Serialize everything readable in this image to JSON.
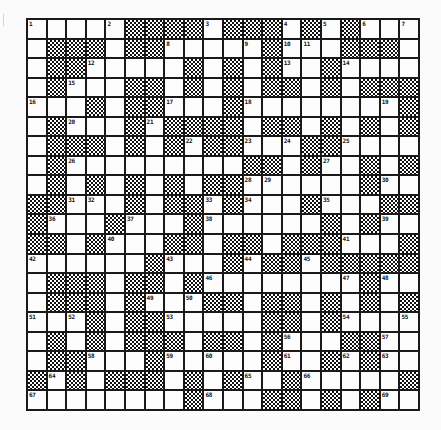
{
  "puzzle": {
    "type": "crossword",
    "rows": 20,
    "cols": 20,
    "colors": {
      "grid_line": "#1a1a1a",
      "white_cell": "#fdfdfd",
      "block_pattern_dark": "#111111",
      "page_background": "#fbfbfb"
    },
    "legend": {
      "W": "white (fillable) cell",
      "B": "black (blocked) cell, drawn with checkerboard dither"
    },
    "layout": [
      "WWWWWBBBBWBBBWBWBWWW",
      "WBBBWBBWWWWWBWWWBBBW",
      "WBBWWWWWBWBWBWWBWWWW",
      "WBWWWBBWBWBWBBWBWBBB",
      "WWWBWBBWWWBWWWWWWWWB",
      "WBWWWBWBBBBWBBWBWBWB",
      "WBBBWBWBWBBWWWBBWWWW",
      "WBWWWWWWWWWBBWBWWBWB",
      "WBWBWBWBWBBWWWWWWBWW",
      "BBWWWBWBBWBWWWBWWWBB",
      "BWWWBWWWBWWWWWWBWBWW",
      "BBWBWWWBBWBBWBBBWWWB",
      "WWWWWWBWWWBWBBWBBBBB",
      "WBBBWBBWBWWWWWWWWBWW",
      "WBBBWBWWWBBWBBWBWBWB",
      "WWWBWBBWWWWWBBWBWWWW",
      "WBWBWBBBWBBWBWWWBBWW",
      "WBBWWWBWWWWWBWWBWBWW",
      "BWBWBBBWBWBWWBWWWWWB",
      "WWWWWWWWBWWWBBWBWBWW"
    ],
    "clue_numbers": [
      {
        "row": 0,
        "col": 0,
        "n": "1"
      },
      {
        "row": 0,
        "col": 4,
        "n": "2"
      },
      {
        "row": 0,
        "col": 9,
        "n": "3"
      },
      {
        "row": 0,
        "col": 13,
        "n": "4"
      },
      {
        "row": 0,
        "col": 15,
        "n": "5"
      },
      {
        "row": 0,
        "col": 17,
        "n": "6"
      },
      {
        "row": 0,
        "col": 19,
        "n": "7"
      },
      {
        "row": 1,
        "col": 7,
        "n": "8"
      },
      {
        "row": 1,
        "col": 11,
        "n": "9"
      },
      {
        "row": 1,
        "col": 13,
        "n": "10"
      },
      {
        "row": 1,
        "col": 14,
        "n": "11"
      },
      {
        "row": 2,
        "col": 3,
        "n": "12"
      },
      {
        "row": 2,
        "col": 13,
        "n": "13"
      },
      {
        "row": 2,
        "col": 16,
        "n": "14"
      },
      {
        "row": 3,
        "col": 2,
        "n": "15"
      },
      {
        "row": 4,
        "col": 0,
        "n": "16"
      },
      {
        "row": 4,
        "col": 7,
        "n": "17"
      },
      {
        "row": 4,
        "col": 11,
        "n": "18"
      },
      {
        "row": 4,
        "col": 18,
        "n": "19"
      },
      {
        "row": 5,
        "col": 2,
        "n": "20"
      },
      {
        "row": 5,
        "col": 6,
        "n": "21"
      },
      {
        "row": 6,
        "col": 8,
        "n": "22"
      },
      {
        "row": 6,
        "col": 11,
        "n": "23"
      },
      {
        "row": 6,
        "col": 13,
        "n": "24"
      },
      {
        "row": 6,
        "col": 16,
        "n": "25"
      },
      {
        "row": 7,
        "col": 2,
        "n": "26"
      },
      {
        "row": 7,
        "col": 15,
        "n": "27"
      },
      {
        "row": 8,
        "col": 11,
        "n": "28"
      },
      {
        "row": 8,
        "col": 12,
        "n": "29"
      },
      {
        "row": 8,
        "col": 18,
        "n": "30"
      },
      {
        "row": 9,
        "col": 2,
        "n": "31"
      },
      {
        "row": 9,
        "col": 3,
        "n": "32"
      },
      {
        "row": 9,
        "col": 9,
        "n": "33"
      },
      {
        "row": 9,
        "col": 11,
        "n": "34"
      },
      {
        "row": 9,
        "col": 15,
        "n": "35"
      },
      {
        "row": 10,
        "col": 1,
        "n": "36"
      },
      {
        "row": 10,
        "col": 5,
        "n": "37"
      },
      {
        "row": 10,
        "col": 9,
        "n": "38"
      },
      {
        "row": 10,
        "col": 18,
        "n": "39"
      },
      {
        "row": 11,
        "col": 4,
        "n": "40"
      },
      {
        "row": 11,
        "col": 16,
        "n": "41"
      },
      {
        "row": 12,
        "col": 0,
        "n": "42"
      },
      {
        "row": 12,
        "col": 7,
        "n": "43"
      },
      {
        "row": 12,
        "col": 11,
        "n": "44"
      },
      {
        "row": 12,
        "col": 14,
        "n": "45"
      },
      {
        "row": 13,
        "col": 9,
        "n": "46"
      },
      {
        "row": 13,
        "col": 16,
        "n": "47"
      },
      {
        "row": 13,
        "col": 18,
        "n": "48"
      },
      {
        "row": 14,
        "col": 6,
        "n": "49"
      },
      {
        "row": 14,
        "col": 8,
        "n": "50"
      },
      {
        "row": 15,
        "col": 0,
        "n": "51"
      },
      {
        "row": 15,
        "col": 2,
        "n": "52"
      },
      {
        "row": 15,
        "col": 7,
        "n": "53"
      },
      {
        "row": 15,
        "col": 16,
        "n": "54"
      },
      {
        "row": 15,
        "col": 19,
        "n": "55"
      },
      {
        "row": 16,
        "col": 13,
        "n": "56"
      },
      {
        "row": 16,
        "col": 18,
        "n": "57"
      },
      {
        "row": 17,
        "col": 3,
        "n": "58"
      },
      {
        "row": 17,
        "col": 7,
        "n": "59"
      },
      {
        "row": 17,
        "col": 9,
        "n": "60"
      },
      {
        "row": 17,
        "col": 13,
        "n": "61"
      },
      {
        "row": 17,
        "col": 16,
        "n": "62"
      },
      {
        "row": 17,
        "col": 18,
        "n": "63"
      },
      {
        "row": 18,
        "col": 1,
        "n": "64"
      },
      {
        "row": 18,
        "col": 11,
        "n": "65"
      },
      {
        "row": 18,
        "col": 14,
        "n": "66"
      },
      {
        "row": 19,
        "col": 0,
        "n": "67"
      },
      {
        "row": 19,
        "col": 9,
        "n": "68"
      },
      {
        "row": 19,
        "col": 18,
        "n": "69"
      }
    ]
  }
}
